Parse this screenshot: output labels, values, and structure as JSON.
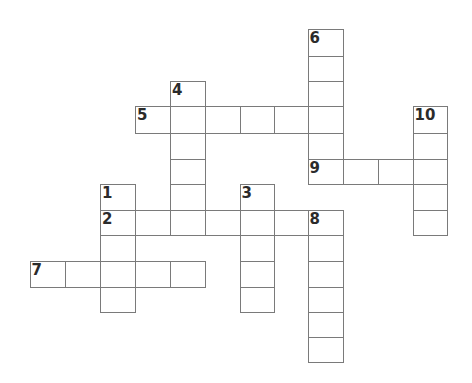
{
  "puzzle": {
    "type": "crossword",
    "grid_color": "#7a7a7a",
    "number_color": "#2b2b2b",
    "col_x": [
      30,
      65,
      100.5,
      135.5,
      170.5,
      205.5,
      240,
      274,
      308,
      343,
      378,
      413,
      447
    ],
    "row_y": [
      29,
      56,
      81,
      106,
      133,
      159,
      184,
      210,
      235,
      261,
      287,
      312,
      337,
      362
    ],
    "entries": [
      {
        "number": "1",
        "direction": "down",
        "col": 2,
        "row": 6,
        "length": 5
      },
      {
        "number": "2",
        "direction": "across",
        "col": 2,
        "row": 7,
        "length": 7
      },
      {
        "number": "3",
        "direction": "down",
        "col": 6,
        "row": 6,
        "length": 5
      },
      {
        "number": "4",
        "direction": "down",
        "col": 4,
        "row": 2,
        "length": 6
      },
      {
        "number": "5",
        "direction": "across",
        "col": 3,
        "row": 3,
        "length": 6
      },
      {
        "number": "6",
        "direction": "down",
        "col": 8,
        "row": 0,
        "length": 6
      },
      {
        "number": "7",
        "direction": "across",
        "col": 0,
        "row": 9,
        "length": 5
      },
      {
        "number": "8",
        "direction": "down",
        "col": 8,
        "row": 7,
        "length": 6
      },
      {
        "number": "9",
        "direction": "across",
        "col": 8,
        "row": 5,
        "length": 4
      },
      {
        "number": "10",
        "direction": "down",
        "col": 11,
        "row": 3,
        "length": 5
      }
    ]
  }
}
